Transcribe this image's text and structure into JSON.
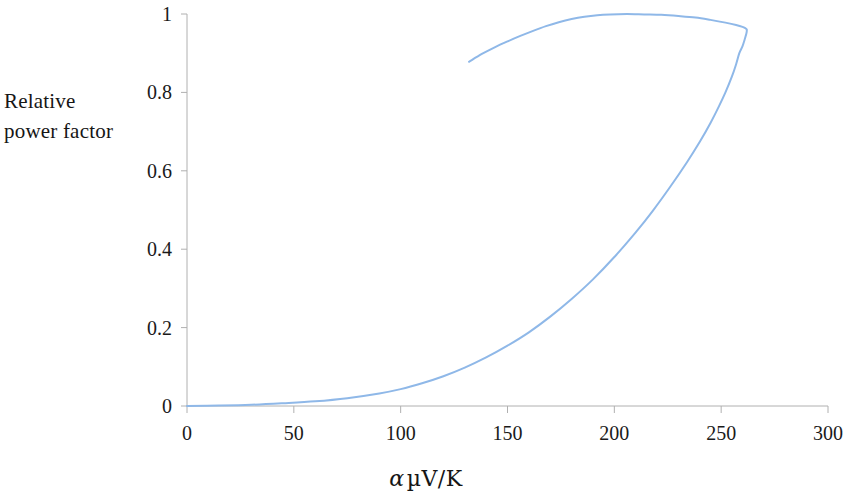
{
  "chart_data": {
    "type": "line",
    "title": "",
    "subtitle": "",
    "xlabel": "α µV/K",
    "ylabel": "Relative power factor",
    "xlabel_parts": {
      "symbol": "α",
      "unit": "µV/K"
    },
    "ylabel_lines": [
      "Relative",
      "power factor"
    ],
    "xlim": [
      0,
      300
    ],
    "ylim": [
      0,
      1
    ],
    "xticks": [
      0,
      50,
      100,
      150,
      200,
      250,
      300
    ],
    "yticks": [
      0,
      0.2,
      0.4,
      0.6,
      0.8,
      1
    ],
    "xtick_labels": [
      "0",
      "50",
      "100",
      "150",
      "200",
      "250",
      "300"
    ],
    "ytick_labels": [
      "0",
      "0.2",
      "0.4",
      "0.6",
      "0.8",
      "1"
    ],
    "grid": false,
    "legend": null,
    "legend_position": "none",
    "line_color": "#8fb8e8",
    "line_width": 2,
    "axis_color": "#a8a8a8",
    "series": [
      {
        "name": "Relative power factor",
        "comment": "single open curve traced from origin along lower branch to peak, then back along upper branch",
        "points": [
          [
            0,
            0.0
          ],
          [
            10,
            0.001
          ],
          [
            20,
            0.002
          ],
          [
            30,
            0.004
          ],
          [
            40,
            0.006
          ],
          [
            50,
            0.009
          ],
          [
            60,
            0.013
          ],
          [
            70,
            0.018
          ],
          [
            80,
            0.025
          ],
          [
            90,
            0.034
          ],
          [
            100,
            0.046
          ],
          [
            110,
            0.062
          ],
          [
            120,
            0.082
          ],
          [
            130,
            0.106
          ],
          [
            140,
            0.134
          ],
          [
            150,
            0.166
          ],
          [
            160,
            0.203
          ],
          [
            170,
            0.245
          ],
          [
            180,
            0.293
          ],
          [
            190,
            0.348
          ],
          [
            200,
            0.41
          ],
          [
            210,
            0.479
          ],
          [
            220,
            0.556
          ],
          [
            225,
            0.598
          ],
          [
            230,
            0.642
          ],
          [
            235,
            0.688
          ],
          [
            240,
            0.737
          ],
          [
            245,
            0.79
          ],
          [
            250,
            0.849
          ],
          [
            254,
            0.903
          ],
          [
            257,
            0.95
          ],
          [
            259,
            0.985
          ],
          [
            260.5,
            1.015
          ],
          [
            261.5,
            1.05
          ],
          [
            262,
            1.09
          ],
          [
            262,
            1.14
          ],
          [
            261.5,
            1.2
          ],
          [
            260,
            1.27
          ],
          [
            257,
            1.35
          ],
          [
            252,
            1.44
          ],
          [
            245,
            1.53
          ],
          [
            236,
            1.62
          ],
          [
            226,
            1.7
          ],
          [
            215,
            1.77
          ],
          [
            204,
            1.825
          ],
          [
            195,
            1.858
          ],
          [
            186,
            1.875
          ],
          [
            176,
            1.87
          ],
          [
            166,
            1.845
          ],
          [
            156,
            1.8
          ],
          [
            146,
            1.735
          ],
          [
            138,
            1.665
          ],
          [
            132,
            1.605
          ]
        ],
        "note_on_points": "values above 1 on the upper branch are expressed in plotted-unit space; see normalized_curve for the as-drawn trace"
      }
    ],
    "normalized_curve": {
      "description": "As-drawn curve in chart coordinates (x = alpha in uV/K, y = relative power factor 0-1). Lower branch starts at origin; upper branch returns leftward and terminates at x=132.",
      "lower_branch": [
        [
          0,
          0.0
        ],
        [
          15,
          0.001
        ],
        [
          30,
          0.003
        ],
        [
          45,
          0.007
        ],
        [
          60,
          0.012
        ],
        [
          75,
          0.02
        ],
        [
          90,
          0.032
        ],
        [
          100,
          0.043
        ],
        [
          110,
          0.058
        ],
        [
          120,
          0.076
        ],
        [
          130,
          0.098
        ],
        [
          140,
          0.124
        ],
        [
          150,
          0.154
        ],
        [
          160,
          0.188
        ],
        [
          170,
          0.228
        ],
        [
          180,
          0.273
        ],
        [
          190,
          0.323
        ],
        [
          200,
          0.38
        ],
        [
          210,
          0.443
        ],
        [
          218,
          0.498
        ],
        [
          226,
          0.558
        ],
        [
          234,
          0.622
        ],
        [
          240,
          0.674
        ],
        [
          245,
          0.722
        ],
        [
          249,
          0.765
        ],
        [
          252,
          0.8
        ],
        [
          255,
          0.84
        ],
        [
          257,
          0.872
        ],
        [
          258.5,
          0.9
        ]
      ],
      "right_turn": [
        [
          258.5,
          0.9
        ],
        [
          260,
          0.918
        ],
        [
          261,
          0.935
        ],
        [
          261.8,
          0.95
        ],
        [
          262,
          0.958
        ],
        [
          261.8,
          0.962
        ]
      ],
      "upper_branch": [
        [
          261.8,
          0.962
        ],
        [
          260,
          0.967
        ],
        [
          257,
          0.972
        ],
        [
          252,
          0.978
        ],
        [
          245,
          0.985
        ],
        [
          238,
          0.991
        ],
        [
          230,
          0.995
        ],
        [
          222,
          0.998
        ],
        [
          214,
          0.999
        ],
        [
          206,
          1.0
        ],
        [
          198,
          0.999
        ],
        [
          192,
          0.997
        ],
        [
          186,
          0.993
        ],
        [
          180,
          0.987
        ],
        [
          174,
          0.979
        ],
        [
          168,
          0.969
        ],
        [
          162,
          0.957
        ],
        [
          156,
          0.944
        ],
        [
          150,
          0.93
        ],
        [
          144,
          0.915
        ],
        [
          138,
          0.898
        ],
        [
          132,
          0.878
        ]
      ]
    },
    "annotations": [],
    "peak": {
      "x": 195,
      "y": 1.0,
      "label": "maximum relative power factor"
    },
    "curve_start": {
      "x": 0,
      "y": 0
    },
    "curve_end": {
      "x": 132,
      "y": 0.878
    },
    "rightmost_point": {
      "x": 262,
      "y": 0.955
    }
  },
  "figure": {
    "background": "#ffffff",
    "plot_area": {
      "left_px": 187,
      "right_px": 828,
      "top_px": 14,
      "bottom_px": 406
    }
  }
}
